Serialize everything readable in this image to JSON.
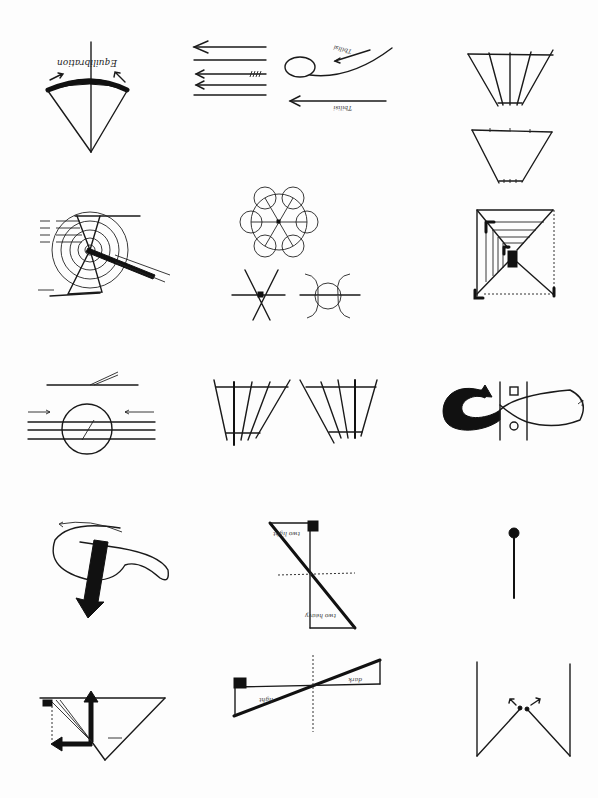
{
  "page": {
    "title": "",
    "background": "#fdfdfd",
    "ink_color": "#111111"
  },
  "diagrams": [
    {
      "id": "equilibration-fan",
      "row": 1,
      "col": 1,
      "labels": {
        "main": "Equilibration"
      }
    },
    {
      "id": "parallel-arrows",
      "row": 1,
      "col": 2,
      "labels": {
        "loop": "~",
        "upper": "Tbilisi",
        "lower": "Tbilisi",
        "top_right": "~ ~"
      }
    },
    {
      "id": "trapezoid-pair",
      "row": 1,
      "col": 3,
      "labels": {}
    },
    {
      "id": "concentric-target",
      "row": 2,
      "col": 1,
      "labels": {}
    },
    {
      "id": "six-circle-rosette",
      "row": 2,
      "col": 2,
      "labels": {}
    },
    {
      "id": "perspective-corridor",
      "row": 2,
      "col": 3,
      "labels": {}
    },
    {
      "id": "circle-on-lines",
      "row": 3,
      "col": 1,
      "labels": {}
    },
    {
      "id": "mirrored-trapezoids",
      "row": 3,
      "col": 2,
      "labels": {}
    },
    {
      "id": "infinity-loop",
      "row": 3,
      "col": 3,
      "labels": {}
    },
    {
      "id": "spiral-arrow",
      "row": 4,
      "col": 1,
      "labels": {}
    },
    {
      "id": "hourglass-balance",
      "row": 4,
      "col": 2,
      "labels": {
        "top": "two light",
        "bottom": "two heavy",
        "center": "C"
      }
    },
    {
      "id": "pin-stick",
      "row": 4,
      "col": 3,
      "labels": {}
    },
    {
      "id": "force-triangle",
      "row": 5,
      "col": 1,
      "labels": {
        "vertical": "I",
        "horizontal": "I"
      }
    },
    {
      "id": "seesaw-lever",
      "row": 5,
      "col": 2,
      "labels": {
        "left": "light",
        "right": "dark"
      }
    },
    {
      "id": "w-channel",
      "row": 5,
      "col": 3,
      "labels": {}
    }
  ]
}
